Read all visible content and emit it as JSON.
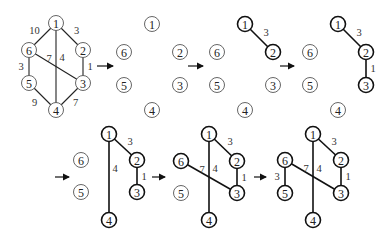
{
  "diagram": {
    "original_graph": {
      "nodes": [
        "1",
        "2",
        "3",
        "4",
        "5",
        "6"
      ],
      "edges": [
        {
          "from": "1",
          "to": "6",
          "weight": "10"
        },
        {
          "from": "1",
          "to": "2",
          "weight": "3"
        },
        {
          "from": "1",
          "to": "4",
          "weight": "4"
        },
        {
          "from": "2",
          "to": "3",
          "weight": "1"
        },
        {
          "from": "6",
          "to": "3",
          "weight": "7"
        },
        {
          "from": "6",
          "to": "5",
          "weight": "3"
        },
        {
          "from": "5",
          "to": "4",
          "weight": "9"
        },
        {
          "from": "3",
          "to": "4",
          "weight": "7"
        }
      ]
    },
    "steps": [
      {
        "label": "step-0-original",
        "edges_shown": "all"
      },
      {
        "label": "step-1",
        "tree_edges": []
      },
      {
        "label": "step-2",
        "tree_edges": [
          {
            "from": "1",
            "to": "2",
            "weight": "3"
          }
        ]
      },
      {
        "label": "step-3",
        "tree_edges": [
          {
            "from": "1",
            "to": "2",
            "weight": "3"
          },
          {
            "from": "2",
            "to": "3",
            "weight": "1"
          }
        ]
      },
      {
        "label": "step-4",
        "tree_edges": [
          {
            "from": "1",
            "to": "2",
            "weight": "3"
          },
          {
            "from": "2",
            "to": "3",
            "weight": "1"
          },
          {
            "from": "1",
            "to": "4",
            "weight": "4"
          }
        ]
      },
      {
        "label": "step-5",
        "tree_edges": [
          {
            "from": "1",
            "to": "2",
            "weight": "3"
          },
          {
            "from": "2",
            "to": "3",
            "weight": "1"
          },
          {
            "from": "1",
            "to": "4",
            "weight": "4"
          },
          {
            "from": "6",
            "to": "3",
            "weight": "7"
          }
        ]
      },
      {
        "label": "step-6",
        "tree_edges": [
          {
            "from": "1",
            "to": "2",
            "weight": "3"
          },
          {
            "from": "2",
            "to": "3",
            "weight": "1"
          },
          {
            "from": "1",
            "to": "4",
            "weight": "4"
          },
          {
            "from": "6",
            "to": "3",
            "weight": "7"
          },
          {
            "from": "6",
            "to": "5",
            "weight": "3"
          }
        ]
      }
    ],
    "arrow_glyph": "→"
  }
}
